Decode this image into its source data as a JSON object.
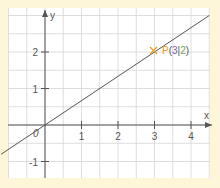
{
  "chart_data": {
    "type": "line",
    "title": "",
    "xlabel": "x",
    "ylabel": "y",
    "xlim": [
      -1,
      4.5
    ],
    "ylim": [
      -1.5,
      3
    ],
    "grid": true,
    "x_ticks": [
      "1",
      "2",
      "3",
      "4"
    ],
    "y_ticks": [
      "2",
      "1",
      "-1"
    ],
    "origin_label": "0",
    "series": [
      {
        "name": "line through origin and P",
        "x": [
          -1.2,
          4.5
        ],
        "y": [
          -0.8,
          3.0
        ],
        "slope": 0.6667
      }
    ],
    "annotations": [
      {
        "label": "P",
        "open": "(",
        "x_value": "3",
        "sep": "|",
        "y_value": "2",
        "close": ")",
        "x": 3,
        "y": 2
      }
    ]
  },
  "colors": {
    "background": "#fdf6d8",
    "plot_background": "#ffffff",
    "grid": "#d0d0d0",
    "axis": "#555555",
    "line": "#555555",
    "point_label": "#e8a020",
    "x_value": "#8a5aa8",
    "y_value": "#6aa84f"
  }
}
